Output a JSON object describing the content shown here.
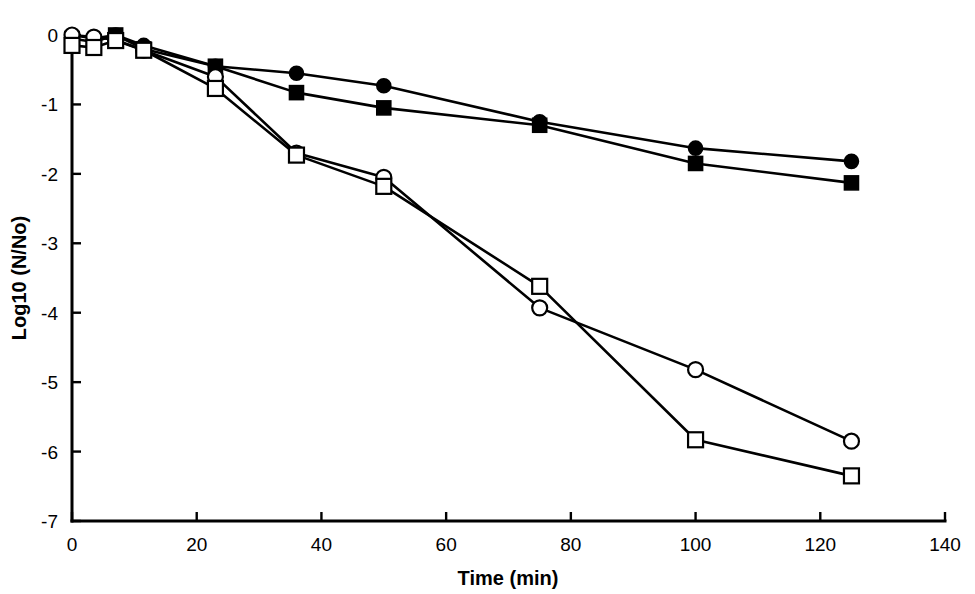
{
  "chart_data": {
    "type": "line",
    "title": "",
    "xlabel": "Time (min)",
    "ylabel": "Log10 (N/No)",
    "xlim": [
      0,
      140
    ],
    "ylim": [
      -7,
      0
    ],
    "xticks": [
      0,
      20,
      40,
      60,
      80,
      100,
      120,
      140
    ],
    "yticks": [
      0,
      -1,
      -2,
      -3,
      -4,
      -5,
      -6,
      -7
    ],
    "xtick_labels": [
      "0",
      "20",
      "40",
      "60",
      "80",
      "100",
      "120",
      "140"
    ],
    "ytick_labels": [
      "0",
      "-1",
      "-2",
      "-3",
      "-4",
      "-5",
      "-6",
      "-7"
    ],
    "grid": false,
    "legend": "none",
    "series": [
      {
        "name": "filled-circle",
        "marker": "filled-circle",
        "x": [
          0,
          3.5,
          7,
          11.5,
          23,
          36,
          50,
          75,
          100,
          125
        ],
        "y": [
          0.0,
          -0.05,
          0.0,
          -0.15,
          -0.45,
          -0.55,
          -0.73,
          -1.25,
          -1.63,
          -1.82
        ]
      },
      {
        "name": "filled-square",
        "marker": "filled-square",
        "x": [
          0,
          3.5,
          7,
          11.5,
          23,
          36,
          50,
          75,
          100,
          125
        ],
        "y": [
          -0.05,
          -0.1,
          0.0,
          -0.2,
          -0.45,
          -0.83,
          -1.05,
          -1.3,
          -1.85,
          -2.13
        ]
      },
      {
        "name": "open-circle",
        "marker": "open-circle",
        "x": [
          0,
          3.5,
          7,
          11.5,
          23,
          36,
          50,
          75,
          100,
          125
        ],
        "y": [
          0.0,
          -0.03,
          -0.07,
          -0.22,
          -0.6,
          -1.7,
          -2.05,
          -3.93,
          -4.82,
          -5.85
        ]
      },
      {
        "name": "open-square",
        "marker": "open-square",
        "x": [
          0,
          3.5,
          7,
          11.5,
          23,
          36,
          50,
          75,
          100,
          125
        ],
        "y": [
          -0.15,
          -0.18,
          -0.08,
          -0.22,
          -0.77,
          -1.73,
          -2.18,
          -3.62,
          -5.83,
          -6.35
        ]
      }
    ],
    "colors": {
      "axis": "#000000",
      "line": "#000000",
      "marker_fill_open": "#ffffff",
      "marker_fill_solid": "#000000",
      "background": "#ffffff"
    }
  }
}
